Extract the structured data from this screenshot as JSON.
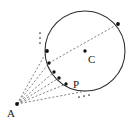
{
  "figure": {
    "type": "geometry-diagram",
    "canvas": {
      "width": 135,
      "height": 124,
      "background": "#ffffff"
    },
    "colors": {
      "circle_stroke": "#2b2b2b",
      "dashed_stroke": "#5a5a5a",
      "point_fill": "#111111",
      "label_fill": "#1a1a1a"
    },
    "circle": {
      "name": "main-circle",
      "center_x": 85,
      "center_y": 51,
      "radius": 40
    },
    "labels": [
      {
        "id": "A",
        "text": "A",
        "x": 7,
        "y": 117,
        "font_size": 11
      },
      {
        "id": "C",
        "text": "C",
        "x": 88,
        "y": 63,
        "font_size": 11
      },
      {
        "id": "P",
        "text": "P",
        "x": 73,
        "y": 88,
        "font_size": 11
      }
    ],
    "points": [
      {
        "id": "A",
        "name": "external-point-a",
        "x": 17,
        "y": 104,
        "r": 1.9
      },
      {
        "id": "C",
        "name": "circle-center-c",
        "x": 85,
        "y": 51,
        "r": 1.7
      },
      {
        "id": "P",
        "name": "point-p",
        "x": 66,
        "y": 84,
        "r": 1.7
      },
      {
        "id": "T1",
        "name": "intersection-point-1",
        "x": 47,
        "y": 51,
        "r": 1.9
      },
      {
        "id": "T2",
        "name": "intersection-point-2",
        "x": 49,
        "y": 63,
        "r": 1.7
      },
      {
        "id": "T3",
        "name": "intersection-point-3",
        "x": 54,
        "y": 72,
        "r": 1.7
      },
      {
        "id": "T4",
        "name": "intersection-point-4",
        "x": 59,
        "y": 78,
        "r": 1.7
      },
      {
        "id": "D",
        "name": "diameter-endpoint",
        "x": 118,
        "y": 24,
        "r": 1.9
      }
    ],
    "rays": [
      {
        "id": "ray-1",
        "x1": 17,
        "y1": 104,
        "x2": 47,
        "y2": 51
      },
      {
        "id": "ray-2",
        "x1": 17,
        "y1": 104,
        "x2": 49,
        "y2": 63
      },
      {
        "id": "ray-3",
        "x1": 17,
        "y1": 104,
        "x2": 54,
        "y2": 72
      },
      {
        "id": "ray-4",
        "x1": 17,
        "y1": 104,
        "x2": 59,
        "y2": 78
      },
      {
        "id": "ray-5",
        "x1": 17,
        "y1": 104,
        "x2": 66,
        "y2": 84
      },
      {
        "id": "ray-6",
        "x1": 17,
        "y1": 104,
        "x2": 86,
        "y2": 91
      }
    ],
    "diameter": {
      "id": "diameter-line",
      "x1": 49,
      "y1": 63,
      "x2": 118,
      "y2": 24
    },
    "ellipsis_vertical": {
      "name": "vertical-ellipsis",
      "dots": [
        {
          "x": 40,
          "y": 33,
          "r": 0.85
        },
        {
          "x": 40,
          "y": 38,
          "r": 0.85
        },
        {
          "x": 40,
          "y": 43,
          "r": 0.85
        }
      ]
    },
    "ellipsis_diagonal": {
      "name": "diagonal-ellipsis",
      "dots": [
        {
          "x": 79,
          "y": 97,
          "r": 0.85
        },
        {
          "x": 84,
          "y": 96,
          "r": 0.85
        },
        {
          "x": 89,
          "y": 95,
          "r": 0.85
        }
      ]
    }
  }
}
